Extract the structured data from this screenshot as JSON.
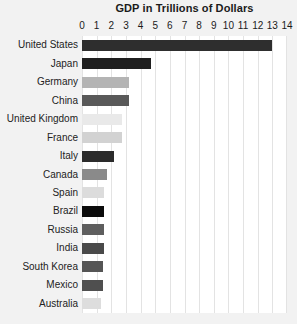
{
  "chart_data": {
    "type": "bar",
    "orientation": "horizontal",
    "title": "GDP in Trillions of Dollars",
    "subtitle": "",
    "xlabel": "",
    "ylabel": "",
    "xlim": [
      0,
      14
    ],
    "ylim": null,
    "grid": true,
    "legend": null,
    "legend_position": "none",
    "x_ticks": [
      0,
      1,
      2,
      3,
      4,
      5,
      6,
      7,
      8,
      9,
      10,
      11,
      12,
      13,
      14
    ],
    "x_tick_labels": [
      "0",
      "1",
      "2",
      "3",
      "4",
      "5",
      "6",
      "7",
      "8",
      "9",
      "10",
      "11",
      "12",
      "13",
      "14"
    ],
    "categories": [
      "United States",
      "Japan",
      "Germany",
      "China",
      "United Kingdom",
      "France",
      "Italy",
      "Canada",
      "Spain",
      "Brazil",
      "Russia",
      "India",
      "South Korea",
      "Mexico",
      "Australia"
    ],
    "values": [
      13.0,
      4.7,
      3.2,
      3.2,
      2.7,
      2.7,
      2.2,
      1.7,
      1.5,
      1.5,
      1.5,
      1.5,
      1.4,
      1.4,
      1.3
    ],
    "bar_colors": [
      "#2e2e2e",
      "#1f1f1f",
      "#b4b4b4",
      "#595959",
      "#e9e9e9",
      "#d2d2d2",
      "#2b2b2b",
      "#8a8a8a",
      "#dcdcdc",
      "#0b0b0b",
      "#5e5e5e",
      "#4a4a4a",
      "#555555",
      "#4f4f4f",
      "#dddddd"
    ],
    "annotations": []
  },
  "style": {
    "page_background": "#f2f2f2",
    "plot_background": "#ffffff",
    "gridline_color": "#e3e3e3",
    "title_color": "#1b1b1b",
    "label_color": "#222222"
  }
}
